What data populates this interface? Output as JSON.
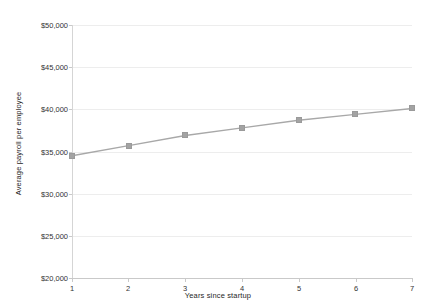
{
  "chart_data": {
    "type": "line",
    "title": "",
    "xlabel": "Years since startup",
    "ylabel": "Average payroll per employee",
    "x": [
      1,
      2,
      3,
      4,
      5,
      6,
      7
    ],
    "values": [
      34500,
      35700,
      36900,
      37800,
      38700,
      39400,
      40100
    ],
    "categories": [
      "1",
      "2",
      "3",
      "4",
      "5",
      "6",
      "7"
    ],
    "xtick_labels": [
      "1",
      "2",
      "3",
      "4",
      "5",
      "6",
      "7"
    ],
    "ytick_labels": [
      "$20,000",
      "$25,000",
      "$30,000",
      "$35,000",
      "$40,000",
      "$45,000",
      "$50,000"
    ],
    "ytick_values": [
      20000,
      25000,
      30000,
      35000,
      40000,
      45000,
      50000
    ],
    "xlim": [
      1,
      7
    ],
    "ylim": [
      20000,
      50000
    ],
    "grid": true,
    "grid_axis": "y",
    "legend": false,
    "legend_position": "none",
    "series": [
      {
        "name": "Average payroll per employee",
        "values": [
          34500,
          35700,
          36900,
          37800,
          38700,
          39400,
          40100
        ],
        "color": "#a3a3a3",
        "marker": "square",
        "line_color": "#a8a8a8"
      }
    ],
    "colors": {
      "line": "#a8a8a8",
      "marker": "#a3a3a3",
      "grid": "#ededed",
      "axis": "#c9c9c9",
      "text": "#333333",
      "background": "#ffffff"
    }
  }
}
